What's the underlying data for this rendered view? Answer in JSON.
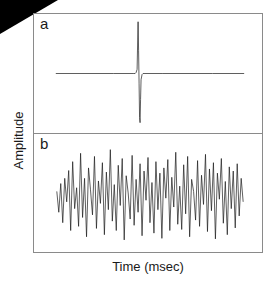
{
  "figure": {
    "background_color": "#ffffff",
    "frame_color": "#8a8a8a",
    "trace_color": "#1a1a1a",
    "corner_wedge_color": "#000000",
    "axes": {
      "xlabel": "Time (msec)",
      "ylabel": "Amplitude"
    },
    "panels": [
      {
        "label": "a",
        "name": "single-spike-panel"
      },
      {
        "label": "b",
        "name": "noise-trace-panel"
      }
    ]
  },
  "chart_data": [
    {
      "type": "line",
      "title": "",
      "panel": "a",
      "xlabel": "Time (msec)",
      "ylabel": "Amplitude",
      "xlim": [
        0,
        230
      ],
      "ylim": [
        -1.15,
        1.15
      ],
      "grid": false,
      "legend": "none",
      "annotations": [
        "a"
      ],
      "description": "Flat baseline with a single sharp biphasic spike near the center: a large positive deflection immediately followed by a large negative deflection.",
      "x": [
        22,
        80,
        100,
        102,
        103,
        104,
        104.5,
        105,
        105.5,
        106,
        106.5,
        107,
        107.5,
        108,
        109,
        110,
        130,
        180,
        212
      ],
      "y": [
        0,
        0,
        0,
        0,
        0.02,
        0.08,
        0.55,
        1.0,
        0.45,
        -0.2,
        -0.85,
        -0.95,
        -0.5,
        -0.12,
        -0.02,
        0,
        0,
        0,
        0
      ]
    },
    {
      "type": "line",
      "title": "",
      "panel": "b",
      "xlabel": "Time (msec)",
      "ylabel": "Amplitude",
      "xlim": [
        0,
        230
      ],
      "ylim": [
        -1.15,
        1.15
      ],
      "grid": false,
      "legend": "none",
      "annotations": [
        "b"
      ],
      "description": "Dense high-frequency noise trace filling the panel; irregular oscillations of varying amplitude spanning roughly the same peak-to-peak range as the spike in panel a.",
      "x": [
        23,
        25,
        27,
        29,
        31,
        33,
        35,
        37,
        39,
        41,
        43,
        45,
        47,
        49,
        51,
        53,
        55,
        57,
        59,
        61,
        63,
        65,
        67,
        69,
        71,
        73,
        75,
        77,
        79,
        81,
        83,
        85,
        87,
        89,
        91,
        93,
        95,
        97,
        99,
        101,
        103,
        105,
        107,
        109,
        111,
        113,
        115,
        117,
        119,
        121,
        123,
        125,
        127,
        129,
        131,
        133,
        135,
        137,
        139,
        141,
        143,
        145,
        147,
        149,
        151,
        153,
        155,
        157,
        159,
        161,
        163,
        165,
        167,
        169,
        171,
        173,
        175,
        177,
        179,
        181,
        183,
        185,
        187,
        189,
        191,
        193,
        195,
        197,
        199,
        201,
        203,
        205,
        207,
        209,
        211
      ],
      "y": [
        0.05,
        -0.35,
        0.2,
        -0.55,
        0.3,
        -0.15,
        0.45,
        -0.7,
        0.62,
        -0.28,
        0.12,
        -0.62,
        0.78,
        -0.45,
        0.3,
        -0.82,
        0.5,
        0.08,
        -0.4,
        0.72,
        -0.66,
        0.25,
        -0.18,
        0.6,
        -0.78,
        0.42,
        -0.3,
        0.85,
        -0.52,
        0.18,
        -0.7,
        0.55,
        -0.22,
        0.68,
        -0.88,
        0.35,
        0.02,
        -0.48,
        0.74,
        -0.6,
        0.28,
        -0.35,
        0.58,
        -0.8,
        0.44,
        -0.12,
        0.7,
        -0.55,
        0.22,
        -0.75,
        0.62,
        -0.3,
        0.4,
        -0.85,
        0.5,
        -0.08,
        0.66,
        -0.7,
        0.32,
        -0.25,
        0.8,
        -0.58,
        0.15,
        -0.68,
        0.56,
        -0.38,
        0.72,
        -0.82,
        0.28,
        0.05,
        -0.5,
        0.64,
        -0.62,
        0.36,
        -0.2,
        0.76,
        -0.72,
        0.48,
        -0.32,
        0.6,
        -0.86,
        0.4,
        -0.1,
        0.68,
        -0.56,
        0.24,
        -0.78,
        0.52,
        -0.28,
        0.44,
        -0.65,
        0.58,
        -0.42,
        0.3,
        -0.15
      ]
    }
  ]
}
